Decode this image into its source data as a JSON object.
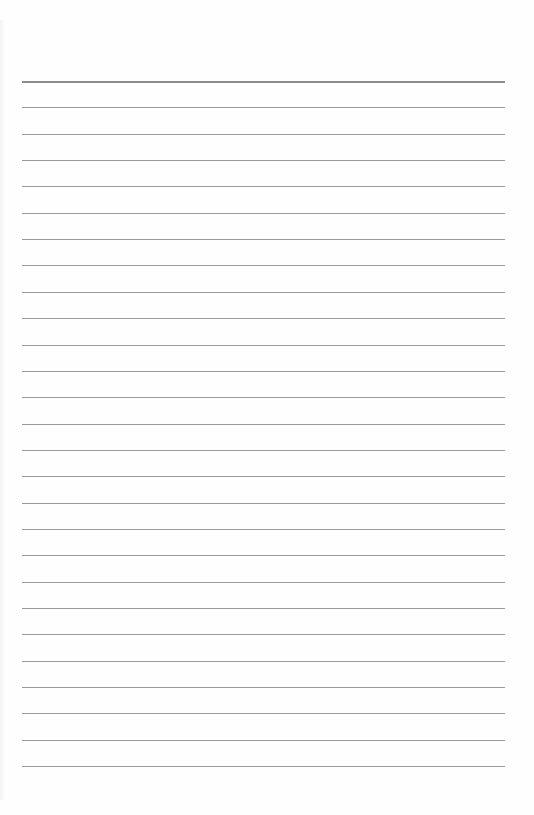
{
  "page": {
    "type": "lined-paper",
    "background_color": "#fefefe",
    "line_color": "#9a9a9a",
    "top_line_color": "#8c8c8c",
    "line_count": 27,
    "first_line_y": 81,
    "line_spacing": 26.35,
    "line_left": 22,
    "line_width": 483
  }
}
